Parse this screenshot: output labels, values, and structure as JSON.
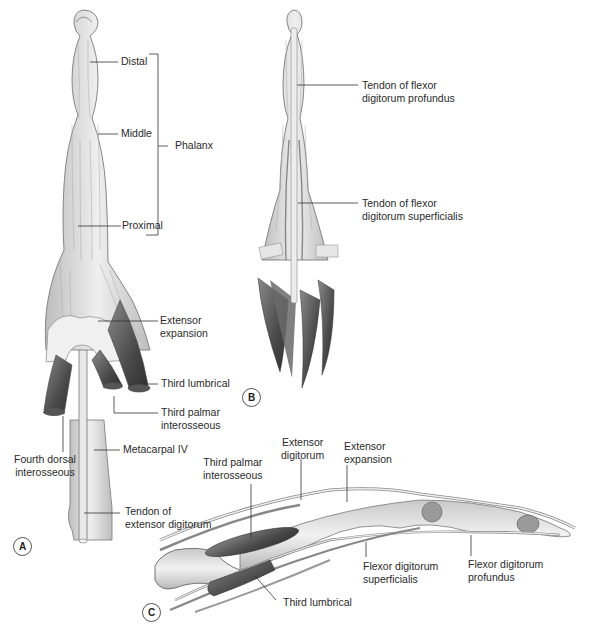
{
  "figure": {
    "panels": [
      {
        "id": "A",
        "view": "dorsal view of finger (extensor side)",
        "labels": {
          "distal": "Distal",
          "middle": "Middle",
          "proximal": "Proximal",
          "phalanx": "Phalanx",
          "extensor_expansion": [
            "Extensor",
            "expansion"
          ],
          "third_lumbrical": "Third lumbrical",
          "third_palmar_interosseous": [
            "Third palmar",
            "interosseous"
          ],
          "fourth_dorsal_interosseous": [
            "Fourth dorsal",
            "interosseous"
          ],
          "metacarpal_iv": "Metacarpal IV",
          "tendon_extensor_digitorum": [
            "Tendon of",
            "extensor digitorum"
          ]
        }
      },
      {
        "id": "B",
        "view": "palmar view of finger (flexor side)",
        "labels": {
          "tendon_fdp": [
            "Tendon of flexor",
            "digitorum profundus"
          ],
          "tendon_fds": [
            "Tendon of flexor",
            "digitorum superficialis"
          ]
        }
      },
      {
        "id": "C",
        "view": "lateral view of finger",
        "labels": {
          "extensor_digitorum": [
            "Extensor",
            "digitorum"
          ],
          "extensor_expansion": [
            "Extensor",
            "expansion"
          ],
          "third_palmar_interosseous": [
            "Third palmar",
            "interosseous"
          ],
          "flexor_digitorum_superficialis": [
            "Flexor digitorum",
            "superficialis"
          ],
          "flexor_digitorum_profundus": [
            "Flexor digitorum",
            "profundus"
          ],
          "third_lumbrical": "Third lumbrical"
        }
      }
    ],
    "colors": {
      "tissue_fill": "#d9d9d9",
      "tissue_light": "#ececec",
      "muscle_dark": "#5a5a5a",
      "outline": "#6e6e6e",
      "leader_line": "#333333",
      "text": "#2a2a2a"
    }
  }
}
